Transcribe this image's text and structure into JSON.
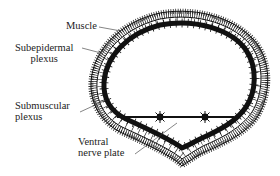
{
  "diagram": {
    "type": "anatomical cross-section",
    "labels": {
      "muscle": "Muscle",
      "subepidermal": {
        "line1": "Subepidermal",
        "line2": "plexus"
      },
      "submuscular": {
        "line1": "Submuscular",
        "line2": "plexus"
      },
      "ventral": {
        "line1": "Ventral",
        "line2": "nerve plate"
      }
    },
    "colors": {
      "ink": "#111111",
      "background": "#ffffff",
      "label_text": "#222222"
    }
  }
}
